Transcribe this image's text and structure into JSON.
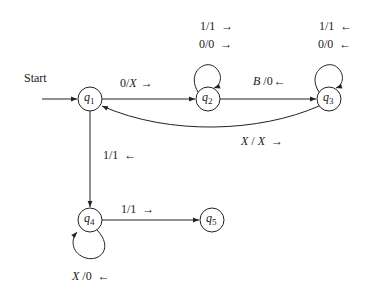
{
  "diagram": {
    "type": "turing-machine-state-diagram",
    "start_label": "Start",
    "states": [
      {
        "id": "q1",
        "name": "q",
        "sub": "1",
        "cx": 90,
        "cy": 99
      },
      {
        "id": "q2",
        "name": "q",
        "sub": "2",
        "cx": 208,
        "cy": 99
      },
      {
        "id": "q3",
        "name": "q",
        "sub": "3",
        "cx": 329,
        "cy": 99
      },
      {
        "id": "q4",
        "name": "q",
        "sub": "4",
        "cx": 90,
        "cy": 220
      },
      {
        "id": "q5",
        "name": "q",
        "sub": "5",
        "cx": 212,
        "cy": 220
      }
    ],
    "transitions": [
      {
        "from": "q1",
        "to": "q2",
        "read": "0",
        "write": "X",
        "move": "R",
        "label": "0/X",
        "dir_glyph": "→"
      },
      {
        "from": "q2",
        "to": "q2",
        "read": "1",
        "write": "1",
        "move": "R",
        "label": "1/1",
        "dir_glyph": "→"
      },
      {
        "from": "q2",
        "to": "q2",
        "read": "0",
        "write": "0",
        "move": "R",
        "label": "0/0",
        "dir_glyph": "→"
      },
      {
        "from": "q2",
        "to": "q3",
        "read": "B",
        "write": "0",
        "move": "L",
        "label": "B /0",
        "dir_glyph": "←"
      },
      {
        "from": "q3",
        "to": "q3",
        "read": "1",
        "write": "1",
        "move": "L",
        "label": "1/1",
        "dir_glyph": "←"
      },
      {
        "from": "q3",
        "to": "q3",
        "read": "0",
        "write": "0",
        "move": "L",
        "label": "0/0",
        "dir_glyph": "←"
      },
      {
        "from": "q3",
        "to": "q1",
        "read": "X",
        "write": "X",
        "move": "R",
        "label": "X /  X",
        "dir_glyph": "→"
      },
      {
        "from": "q1",
        "to": "q4",
        "read": "1",
        "write": "1",
        "move": "L",
        "label": "1/1",
        "dir_glyph": "←"
      },
      {
        "from": "q4",
        "to": "q5",
        "read": "1",
        "write": "1",
        "move": "R",
        "label": "1/1",
        "dir_glyph": "→"
      },
      {
        "from": "q4",
        "to": "q4",
        "read": "X",
        "write": "0",
        "move": "L",
        "label": "X /0",
        "dir_glyph": "←"
      }
    ]
  },
  "labels": {
    "start": "Start",
    "q1_q2": {
      "a": "0/",
      "b": "X",
      "arrow": "→"
    },
    "q2_loop_1": {
      "text": "1/1",
      "arrow": "→"
    },
    "q2_loop_2": {
      "text": "0/0",
      "arrow": "→"
    },
    "q2_q3": {
      "a": "B",
      "b": " /0",
      "arrow": "←"
    },
    "q3_loop_1": {
      "text": "1/1",
      "arrow": "←"
    },
    "q3_loop_2": {
      "text": "0/0",
      "arrow": "←"
    },
    "q3_q1": {
      "a": "X",
      "b": " / ",
      "c": "X",
      "arrow": "→"
    },
    "q1_q4": {
      "text": "1/1",
      "arrow": "←"
    },
    "q4_q5": {
      "text": "1/1",
      "arrow": "→"
    },
    "q4_loop": {
      "a": "X",
      "b": " /0",
      "arrow": "←"
    }
  },
  "states_text": {
    "q": "q",
    "s1": "1",
    "s2": "2",
    "s3": "3",
    "s4": "4",
    "s5": "5"
  }
}
